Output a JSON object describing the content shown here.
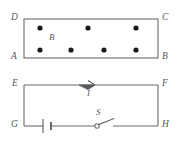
{
  "figure": {
    "width": 178,
    "height": 141,
    "background_color": "#ffffff",
    "stroke_color": "#6b6b6d",
    "dot_color": "#1a1a1a",
    "label_color": "#58585a"
  },
  "field_region": {
    "name": "magnetic-field-rectangle",
    "corner_labels": {
      "top_left": "D",
      "top_right": "C",
      "bottom_left": "A",
      "bottom_right": "B"
    },
    "field_label": "B",
    "field_direction": "out-of-page",
    "dot_symbol": "•",
    "rect": {
      "x": 24,
      "y": 19,
      "width": 134,
      "height": 39
    },
    "dots_top_row": [
      {
        "x": 40,
        "y": 28
      },
      {
        "x": 88,
        "y": 28
      },
      {
        "x": 136,
        "y": 28
      }
    ],
    "dots_bottom_row": [
      {
        "x": 40,
        "y": 50
      },
      {
        "x": 71,
        "y": 50
      },
      {
        "x": 104,
        "y": 50
      },
      {
        "x": 136,
        "y": 50
      }
    ],
    "field_label_pos": {
      "x": 50,
      "y": 36
    }
  },
  "circuit": {
    "name": "circuit-rectangle",
    "corner_labels": {
      "top_left": "E",
      "top_right": "F",
      "bottom_left": "G",
      "bottom_right": "H"
    },
    "rect": {
      "x": 24,
      "y": 85,
      "width": 134,
      "height": 41
    },
    "current_label": "I",
    "current_direction": "rightward",
    "arrow_pos": {
      "x": 88,
      "y": 85
    },
    "current_label_pos": {
      "x": 87,
      "y": 89
    },
    "battery": {
      "label": "",
      "center_x": 47,
      "long_plate_half_height": 7,
      "short_plate_half_height": 4
    },
    "switch": {
      "label": "S",
      "state": "open",
      "pivot": {
        "x": 97,
        "y": 126
      },
      "lever_tip": {
        "x": 113,
        "y": 119
      },
      "label_pos": {
        "x": 96,
        "y": 113
      },
      "gap_right_x": 113
    }
  }
}
